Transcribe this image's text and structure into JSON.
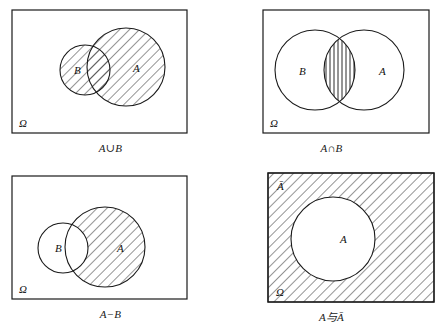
{
  "figure": {
    "stroke_color": "#1a1a1a",
    "hatch_color": "#2a2a2a",
    "background": "#ffffff",
    "panels": [
      {
        "id": "union",
        "caption": "A∪B",
        "universe_label": "Ω",
        "circle_labels": {
          "left": "B",
          "right": "A"
        },
        "shaded_region": "A union B",
        "hatch_style": "diagonal-45",
        "left_circle": {
          "cx": 85,
          "cy": 70,
          "r": 25
        },
        "right_circle": {
          "cx": 126,
          "cy": 67,
          "r": 39
        },
        "rect": {
          "x": 12,
          "y": 10,
          "w": 175,
          "h": 123
        },
        "label_positions": {
          "left": {
            "x": 74,
            "y": 74
          },
          "right": {
            "x": 133,
            "y": 72
          },
          "omega": {
            "x": 19,
            "y": 127
          }
        }
      },
      {
        "id": "intersection",
        "caption": "A∩B",
        "universe_label": "Ω",
        "circle_labels": {
          "left": "B",
          "right": "A"
        },
        "shaded_region": "A intersect B",
        "hatch_style": "vertical",
        "left_circle": {
          "cx": 94,
          "cy": 70,
          "r": 40
        },
        "right_circle": {
          "cx": 143,
          "cy": 70,
          "r": 40
        },
        "rect": {
          "x": 42,
          "y": 10,
          "w": 166,
          "h": 123
        },
        "label_positions": {
          "left": {
            "x": 78,
            "y": 75
          },
          "right": {
            "x": 158,
            "y": 75
          },
          "omega": {
            "x": 49,
            "y": 127
          }
        }
      },
      {
        "id": "difference",
        "caption": "A−B",
        "universe_label": "Ω",
        "circle_labels": {
          "left": "B",
          "right": "A"
        },
        "shaded_region": "A minus B",
        "hatch_style": "diagonal-45",
        "left_circle": {
          "cx": 63,
          "cy": 82,
          "r": 25
        },
        "right_circle": {
          "cx": 105,
          "cy": 81,
          "r": 40
        },
        "rect": {
          "x": 12,
          "y": 10,
          "w": 175,
          "h": 123
        },
        "label_positions": {
          "left": {
            "x": 55,
            "y": 86
          },
          "right": {
            "x": 117,
            "y": 86
          },
          "omega": {
            "x": 19,
            "y": 127
          }
        }
      },
      {
        "id": "complement",
        "caption": "A与Ā",
        "universe_label": "Ω",
        "circle_labels": {
          "inside": "A",
          "outside": "Ā"
        },
        "shaded_region": "complement of A",
        "hatch_style": "diagonal-45",
        "circle": {
          "cx": 112,
          "cy": 73,
          "r": 42
        },
        "rect": {
          "x": 47,
          "y": 7,
          "w": 166,
          "h": 129
        },
        "label_positions": {
          "inside": {
            "x": 119,
            "y": 77
          },
          "outside": {
            "x": 56,
            "y": 24
          },
          "omega": {
            "x": 55,
            "y": 130
          }
        }
      }
    ]
  }
}
